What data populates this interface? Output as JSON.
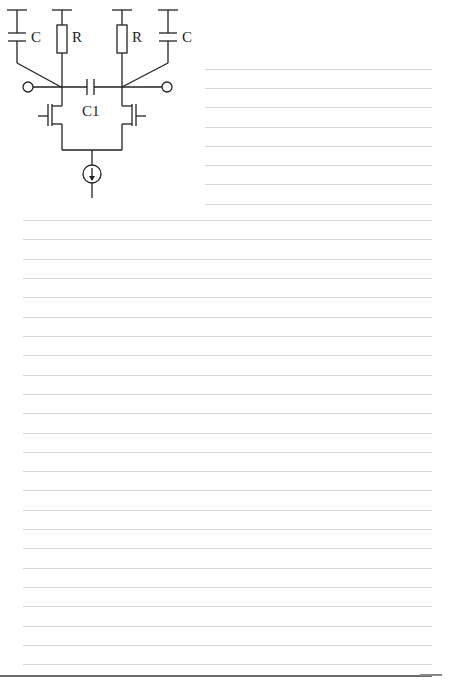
{
  "circuit": {
    "labels": {
      "cap_left": "C",
      "res_left": "R",
      "res_right": "R",
      "cap_right": "C",
      "coupling_cap": "C1"
    },
    "line_color": "#222222"
  },
  "ruled_lines": {
    "right_block": {
      "x_start": 205,
      "x_end": 432,
      "y_positions": [
        69,
        88,
        107,
        127,
        146,
        165,
        184,
        204
      ]
    },
    "full_block": {
      "x_start": 23,
      "x_end": 432,
      "y_start": 220,
      "spacing": 19.32,
      "count": 24
    },
    "color": "#d6d6d6"
  }
}
